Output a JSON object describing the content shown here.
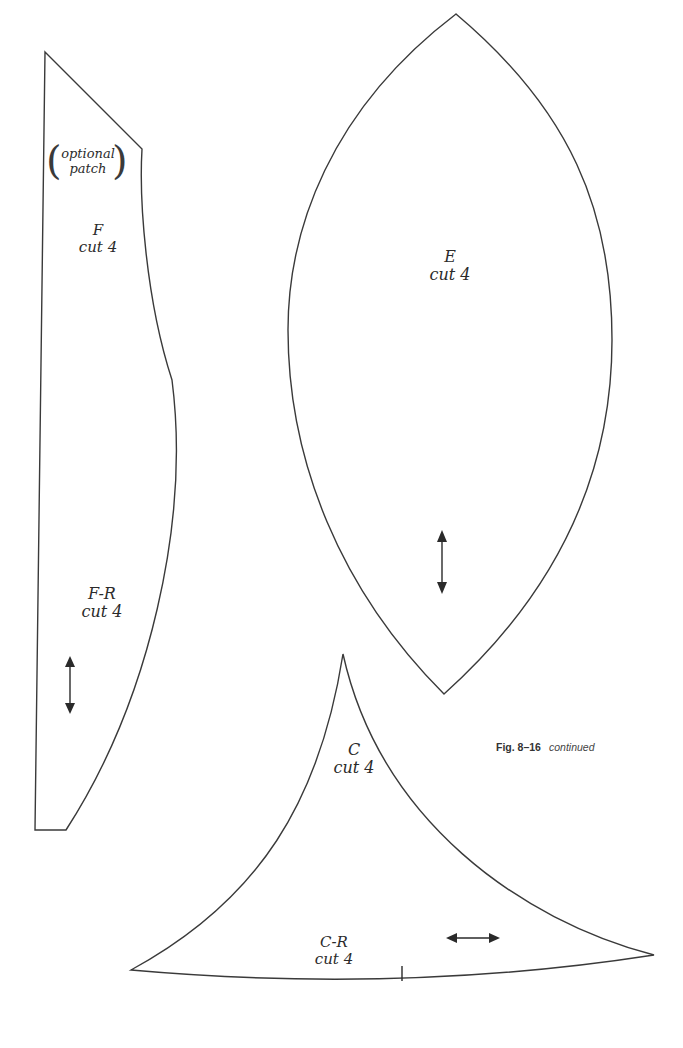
{
  "caption": {
    "figure": "Fig. 8–16",
    "note": "continued"
  },
  "pieces": {
    "F": {
      "note_line1": "optional",
      "note_line2": "patch",
      "name": "F",
      "instruction": "cut 4",
      "grainline": "vertical-double-arrow"
    },
    "FR": {
      "name": "F-R",
      "instruction": "cut 4",
      "grainline": "vertical-double-arrow"
    },
    "E": {
      "name": "E",
      "instruction": "cut 4",
      "grainline": "vertical-double-arrow"
    },
    "C": {
      "name": "C",
      "instruction": "cut 4"
    },
    "CR": {
      "name": "C-R",
      "instruction": "cut 4",
      "grainline": "horizontal-double-arrow"
    }
  },
  "colors": {
    "line": "#3a3a3a",
    "background": "#ffffff"
  }
}
